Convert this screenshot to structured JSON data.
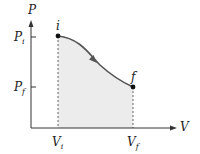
{
  "diagram": {
    "type": "pv-diagram",
    "axes": {
      "x_label": "V",
      "y_label": "P"
    },
    "points": [
      {
        "id": "i",
        "label": "i",
        "volume_label": "V",
        "volume_sub": "i",
        "pressure_label": "P",
        "pressure_sub": "i"
      },
      {
        "id": "f",
        "label": "f",
        "volume_label": "V",
        "volume_sub": "f",
        "pressure_label": "P",
        "pressure_sub": "f"
      }
    ],
    "process": "curve from i to f with direction arrow",
    "shaded_region": "area under curve between V_i and V_f",
    "colors": {
      "curve": "#555555",
      "shade": "#ececec",
      "axis": "#333333",
      "point": "#111111"
    }
  }
}
